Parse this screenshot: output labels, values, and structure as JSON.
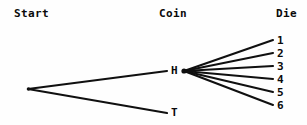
{
  "diagram": {
    "type": "probability-tree",
    "background_color": "#fefefe",
    "line_color": "#101010",
    "text_color": "#0a0a0a",
    "columns": [
      {
        "id": "start",
        "label": "Start",
        "x": 14,
        "y": 8
      },
      {
        "id": "coin",
        "label": "Coin",
        "x": 159,
        "y": 8
      },
      {
        "id": "die",
        "label": "Die",
        "x": 276,
        "y": 8
      }
    ],
    "nodes": {
      "root": {
        "label": "",
        "x": 28,
        "y": 89
      },
      "heads": {
        "label": "H",
        "x": 171,
        "y": 65
      },
      "tails": {
        "label": "T",
        "x": 171,
        "y": 107
      }
    },
    "fan_origin": {
      "x": 184,
      "y": 71
    },
    "die_faces": [
      {
        "label": "1",
        "x": 277,
        "y": 35,
        "line_end_x": 273,
        "line_end_y": 40
      },
      {
        "label": "2",
        "x": 277,
        "y": 48,
        "line_end_x": 273,
        "line_end_y": 53
      },
      {
        "label": "3",
        "x": 277,
        "y": 61,
        "line_end_x": 273,
        "line_end_y": 66
      },
      {
        "label": "4",
        "x": 277,
        "y": 74,
        "line_end_x": 273,
        "line_end_y": 79
      },
      {
        "label": "5",
        "x": 277,
        "y": 87,
        "line_end_x": 273,
        "line_end_y": 92
      },
      {
        "label": "6",
        "x": 277,
        "y": 100,
        "line_end_x": 273,
        "line_end_y": 105
      }
    ],
    "edges": [
      {
        "id": "root-to-heads",
        "from": "root",
        "to": "heads",
        "x1": 28,
        "y1": 89,
        "x2": 167,
        "y2": 71
      },
      {
        "id": "root-to-tails",
        "from": "root",
        "to": "tails",
        "x1": 28,
        "y1": 89,
        "x2": 167,
        "y2": 113
      }
    ]
  }
}
